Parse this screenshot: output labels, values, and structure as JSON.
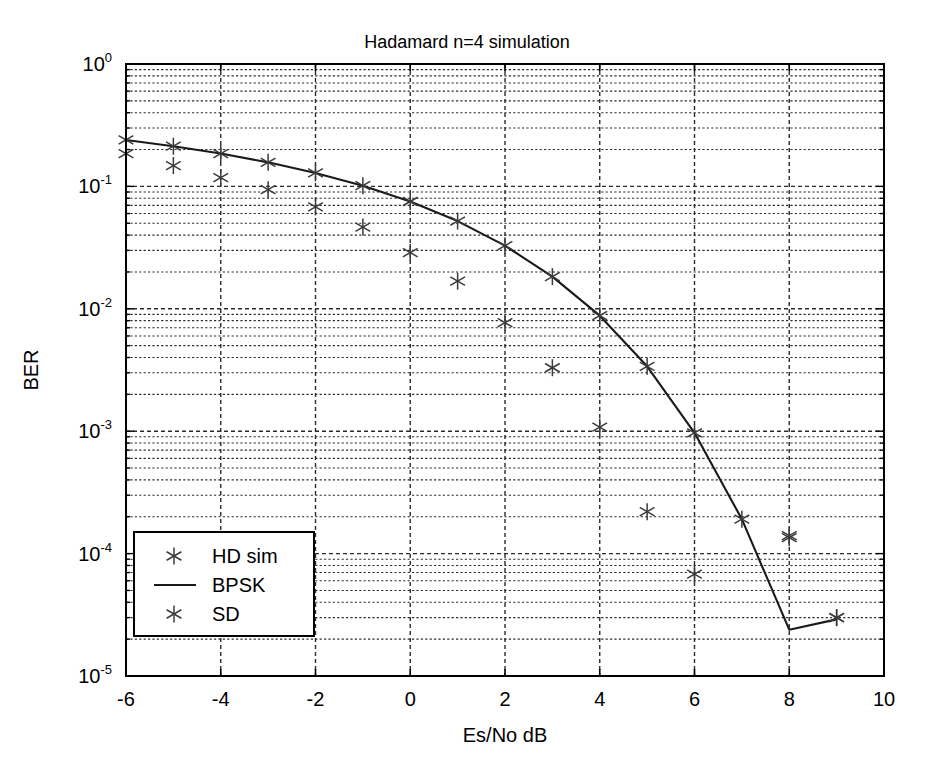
{
  "chart_data": {
    "type": "scatter",
    "title": "Hadamard n=4  simulation",
    "xlabel": "Es/No dB",
    "ylabel": "BER",
    "xlim": [
      -6,
      10
    ],
    "ylim": [
      1e-05,
      1
    ],
    "yscale": "log",
    "xscale": "linear",
    "grid": true,
    "minor_grid": true,
    "legend_position": "lower left",
    "xticks": [
      -6,
      -4,
      -2,
      0,
      2,
      4,
      6,
      8,
      10
    ],
    "xtick_labels": [
      "-6",
      "-4",
      "-2",
      "0",
      "2",
      "4",
      "6",
      "8",
      "10"
    ],
    "yticks": [
      1,
      0.1,
      0.01,
      0.001,
      0.0001,
      1e-05
    ],
    "ytick_labels": [
      "10^0",
      "10^-1",
      "10^-2",
      "10^-3",
      "10^-4",
      "10^-5"
    ],
    "ytick_mantissa": [
      "10",
      "10",
      "10",
      "10",
      "10",
      "10"
    ],
    "ytick_exponent": [
      "0",
      "-1",
      "-2",
      "-3",
      "-4",
      "-5"
    ],
    "series": [
      {
        "name": "HD sim",
        "marker": "asterisk",
        "style": "markers",
        "color": "#3a3a3a",
        "x": [
          -6,
          -5,
          -4,
          -3,
          -2,
          -1,
          0,
          1,
          2,
          3,
          4,
          5,
          6,
          8,
          9
        ],
        "y": [
          0.185,
          0.148,
          0.118,
          0.094,
          0.068,
          0.0465,
          0.0288,
          0.0168,
          0.0077,
          0.0033,
          0.00108,
          0.00022,
          6.8e-05,
          0.000135,
          3e-05
        ]
      },
      {
        "name": "BPSK",
        "marker": "none",
        "style": "line",
        "color": "#1a1a1a",
        "x": [
          -6,
          -5,
          -4,
          -3,
          -2,
          -1,
          0,
          1,
          2,
          3,
          4,
          5,
          6,
          7,
          8,
          9
        ],
        "y": [
          0.2396,
          0.2131,
          0.1855,
          0.1572,
          0.1289,
          0.1013,
          0.0753,
          0.0521,
          0.0328,
          0.0183,
          0.00879,
          0.00339,
          0.00097,
          0.000191,
          2.39e-05,
          2.9e-05
        ]
      },
      {
        "name": "SD",
        "marker": "asterisk",
        "style": "markers",
        "color": "#3a3a3a",
        "x": [
          -6,
          -5,
          -4,
          -3,
          -2,
          -1,
          0,
          1,
          2,
          3,
          4,
          5,
          6,
          7,
          8,
          9
        ],
        "y": [
          0.2396,
          0.2131,
          0.1855,
          0.1572,
          0.1289,
          0.1013,
          0.0753,
          0.0521,
          0.0328,
          0.0183,
          0.00879,
          0.00339,
          0.00097,
          0.000191,
          0.00014,
          3e-05
        ]
      }
    ]
  },
  "legend": {
    "entries": [
      {
        "label": "HD sim",
        "type": "marker"
      },
      {
        "label": "BPSK",
        "type": "line"
      },
      {
        "label": "SD",
        "type": "marker"
      }
    ]
  },
  "colors": {
    "axis": "#000000",
    "grid": "#2b2b2b",
    "line": "#1a1a1a",
    "marker": "#3d3d3d",
    "background": "#ffffff"
  }
}
